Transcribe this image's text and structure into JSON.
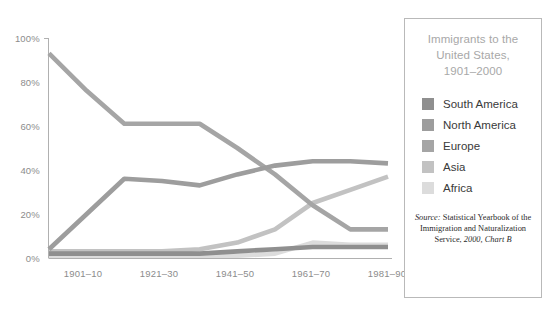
{
  "chart_data": {
    "type": "line",
    "title": "Immigrants to the United States, 1901–2000",
    "xlabel": "",
    "ylabel": "",
    "ylim": [
      0,
      100
    ],
    "ytick_labels": [
      "0%",
      "20%",
      "40%",
      "60%",
      "80%",
      "100%"
    ],
    "ytick_values": [
      0,
      20,
      40,
      60,
      80,
      100
    ],
    "grid": false,
    "legend_position": "right",
    "x": [
      "1901–10",
      "1911–20",
      "1921–30",
      "1931–40",
      "1941–50",
      "1951–60",
      "1961–70",
      "1971–80",
      "1981–90",
      "1991–2000"
    ],
    "xtick_labels": [
      "1901–10",
      "1921–30",
      "1941–50",
      "1961–70",
      "1981–90"
    ],
    "xtick_indices": [
      0,
      2,
      4,
      6,
      8
    ],
    "series": [
      {
        "name": "South America",
        "color": "#8f8f8f",
        "values": [
          2,
          2,
          2,
          2,
          2,
          3,
          4,
          5,
          5,
          5
        ]
      },
      {
        "name": "North America",
        "color": "#9d9d9d",
        "values": [
          4,
          20,
          36,
          35,
          33,
          38,
          42,
          44,
          44,
          43
        ]
      },
      {
        "name": "Europe",
        "color": "#a5a5a5",
        "values": [
          93,
          76,
          61,
          61,
          61,
          50,
          38,
          24,
          13,
          13
        ]
      },
      {
        "name": "Asia",
        "color": "#c2c2c2",
        "values": [
          3,
          3,
          3,
          3,
          4,
          7,
          13,
          25,
          31,
          37
        ]
      },
      {
        "name": "Africa",
        "color": "#dcdcdc",
        "values": [
          1,
          1,
          1,
          1,
          1,
          1,
          2,
          7,
          6,
          6
        ]
      }
    ]
  },
  "legend": {
    "title_lines": [
      "Immigrants to the",
      "United States,",
      "1901–2000"
    ],
    "items": [
      {
        "label": "South America",
        "color": "#8f8f8f"
      },
      {
        "label": "North America",
        "color": "#9d9d9d"
      },
      {
        "label": "Europe",
        "color": "#a5a5a5"
      },
      {
        "label": "Asia",
        "color": "#c2c2c2"
      },
      {
        "label": "Africa",
        "color": "#dcdcdc"
      }
    ],
    "source": {
      "prefix": "Source:",
      "body": " Statistical Yearbook of the Immigration and Naturalization Service,",
      "tail": " 2000, Chart B"
    }
  },
  "axis": {
    "y_labels": [
      "100%",
      "80%",
      "60%",
      "40%",
      "20%",
      "0%"
    ],
    "x_labels": [
      "1901–10",
      "1921–30",
      "1941–50",
      "1961–70",
      "1981–90"
    ]
  },
  "colors": {
    "axis_line": "#b0b0b0",
    "tick_text": "#8c8c8c",
    "legend_border": "#b9b9b9",
    "legend_title_text": "#a8a8a8",
    "legend_label_text": "#3a3a3a",
    "background": "#ffffff"
  }
}
